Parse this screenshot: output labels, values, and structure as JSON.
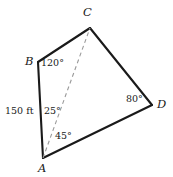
{
  "figure": {
    "type": "geometry-diagram",
    "width": 173,
    "height": 177,
    "background_color": "#ffffff",
    "stroke_color": "#1a1a1a",
    "dashed_stroke_color": "#9a9a9a"
  },
  "vertices": [
    {
      "name": "A",
      "label": "A",
      "x": 43,
      "y": 158,
      "label_x": 38,
      "label_y": 163
    },
    {
      "name": "B",
      "label": "B",
      "x": 38,
      "y": 62,
      "label_x": 25,
      "label_y": 56
    },
    {
      "name": "C",
      "label": "C",
      "x": 90,
      "y": 28,
      "label_x": 83,
      "label_y": 7
    },
    {
      "name": "D",
      "label": "D",
      "x": 152,
      "y": 105,
      "label_x": 157,
      "label_y": 99
    }
  ],
  "edges": [
    {
      "name": "edge-AB",
      "from": "A",
      "to": "B",
      "style": "solid"
    },
    {
      "name": "edge-BC",
      "from": "B",
      "to": "C",
      "style": "solid"
    },
    {
      "name": "edge-CD",
      "from": "C",
      "to": "D",
      "style": "solid"
    },
    {
      "name": "edge-DA",
      "from": "D",
      "to": "A",
      "style": "solid"
    },
    {
      "name": "diagonal-AC",
      "from": "A",
      "to": "C",
      "style": "dashed"
    }
  ],
  "angle_labels": [
    {
      "name": "angle-at-B",
      "text": "120°",
      "x": 41,
      "y": 58
    },
    {
      "name": "angle-BAC",
      "text": "25°",
      "x": 44,
      "y": 106
    },
    {
      "name": "angle-CAD",
      "text": "45°",
      "x": 55,
      "y": 131
    },
    {
      "name": "angle-at-D",
      "text": "80°",
      "x": 126,
      "y": 94
    }
  ],
  "side_labels": [
    {
      "name": "side-AB-length",
      "text": "150 ft",
      "x": 5,
      "y": 106
    }
  ]
}
